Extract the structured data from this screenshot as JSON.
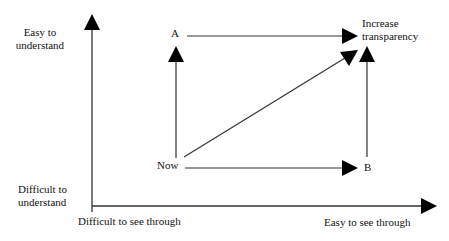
{
  "diagram": {
    "axes": {
      "y_top_label": [
        "Easy to",
        "understand"
      ],
      "y_bottom_label": [
        "Difficult to",
        "understand"
      ],
      "x_left_label": "Difficult to see through",
      "x_right_label": "Easy to see through"
    },
    "nodes": {
      "now": "Now",
      "a": "A",
      "b": "B",
      "goal": [
        "Increase",
        "transparency"
      ]
    },
    "edges": [
      {
        "from": "Now",
        "to": "A"
      },
      {
        "from": "Now",
        "to": "B"
      },
      {
        "from": "Now",
        "to": "Increase transparency"
      },
      {
        "from": "A",
        "to": "Increase transparency"
      },
      {
        "from": "B",
        "to": "Increase transparency"
      }
    ],
    "colors": {
      "line": "#333333",
      "arrowhead": "#000000",
      "text": "#111111"
    }
  }
}
